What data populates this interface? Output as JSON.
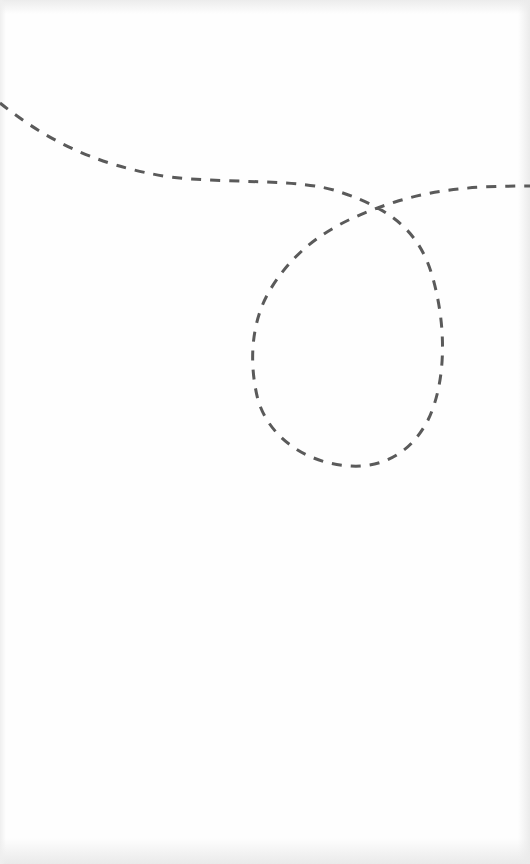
{
  "diagram": {
    "background_color": "#fefefe",
    "stroke_color": "#5a5a5a",
    "stroke_width": 3,
    "dash_pattern": "10 9",
    "curve": {
      "start": [
        0,
        103
      ],
      "crossing_point": [
        376,
        210
      ],
      "end": [
        530,
        186
      ],
      "path": "M 0 103 C 40 135, 90 165, 170 177 C 230 184, 300 178, 340 192 C 395 210, 420 235, 432 275 C 448 330, 445 385, 428 420 C 410 455, 380 468, 350 466 C 310 464, 270 440, 258 400 C 248 360, 252 320, 270 290 C 300 240, 345 218, 395 202 C 440 188, 480 186, 530 186"
    }
  }
}
